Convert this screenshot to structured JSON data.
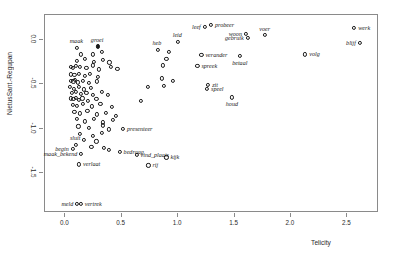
{
  "chart_data": {
    "type": "scatter",
    "title": "",
    "xlabel": "Telicity",
    "ylabel": "NietusSant.-Regupan",
    "xlim": [
      -0.18,
      2.78
    ],
    "ylim": [
      -1.95,
      0.28
    ],
    "xticks": [
      "0.0",
      "0.5",
      "1.0",
      "1.5",
      "2.0",
      "2.5"
    ],
    "xtickvals": [
      0.0,
      0.5,
      1.0,
      1.5,
      2.0,
      2.5
    ],
    "yticks": [
      "0.0",
      "-0.5",
      "-1.0",
      "-1.5"
    ],
    "ytickvals": [
      0.0,
      -0.5,
      -1.0,
      -1.5
    ],
    "grid": false,
    "legend": null,
    "marker": "open-circle",
    "labeled_points": [
      {
        "label": "maak",
        "x": 0.115,
        "y": -0.1,
        "side": "above-left"
      },
      {
        "label": "groei",
        "x": 0.3,
        "y": -0.085,
        "side": "above-left",
        "filled": true
      },
      {
        "label": "leid",
        "x": 1.01,
        "y": -0.035,
        "side": "above-left"
      },
      {
        "label": "heb",
        "x": 0.83,
        "y": -0.125,
        "side": "above-left"
      },
      {
        "label": "leef",
        "x": 1.245,
        "y": 0.135,
        "side": "left"
      },
      {
        "label": "probeer",
        "x": 1.3,
        "y": 0.155,
        "side": "right"
      },
      {
        "label": "woon",
        "x": 1.61,
        "y": 0.06,
        "side": "left"
      },
      {
        "label": "gebruik",
        "x": 1.625,
        "y": 0.015,
        "side": "left"
      },
      {
        "label": "voer",
        "x": 1.775,
        "y": 0.048,
        "side": "above"
      },
      {
        "label": "werk",
        "x": 2.57,
        "y": 0.125,
        "side": "right"
      },
      {
        "label": "blijf",
        "x": 2.62,
        "y": -0.045,
        "side": "left"
      },
      {
        "label": "verander",
        "x": 1.215,
        "y": -0.185,
        "side": "right"
      },
      {
        "label": "spreek",
        "x": 1.18,
        "y": -0.305,
        "side": "right"
      },
      {
        "label": "betaal",
        "x": 1.555,
        "y": -0.195,
        "side": "below"
      },
      {
        "label": "volg",
        "x": 2.135,
        "y": -0.175,
        "side": "right"
      },
      {
        "label": "zit",
        "x": 1.275,
        "y": -0.515,
        "side": "right"
      },
      {
        "label": "speel",
        "x": 1.265,
        "y": -0.565,
        "side": "right"
      },
      {
        "label": "houd",
        "x": 1.485,
        "y": -0.66,
        "side": "below"
      },
      {
        "label": "presenteer",
        "x": 0.52,
        "y": -1.01,
        "side": "right"
      },
      {
        "label": "sluit",
        "x": 0.105,
        "y": -1.195,
        "side": "above-left"
      },
      {
        "label": "begin",
        "x": 0.075,
        "y": -1.24,
        "side": "left"
      },
      {
        "label": "maak_bekend",
        "x": 0.15,
        "y": -1.3,
        "side": "left"
      },
      {
        "label": "bedraag",
        "x": 0.49,
        "y": -1.27,
        "side": "right"
      },
      {
        "label": "vind_plaats",
        "x": 0.64,
        "y": -1.305,
        "side": "right"
      },
      {
        "label": "kijk",
        "x": 0.905,
        "y": -1.335,
        "side": "right"
      },
      {
        "label": "verlaat",
        "x": 0.13,
        "y": -1.415,
        "side": "right"
      },
      {
        "label": "rij",
        "x": 0.745,
        "y": -1.425,
        "side": "right"
      },
      {
        "label": "meld",
        "x": 0.115,
        "y": -1.855,
        "side": "left"
      },
      {
        "label": "vertrek",
        "x": 0.145,
        "y": -1.855,
        "side": "right"
      }
    ],
    "unlabeled_points": [
      {
        "x": 0.15,
        "y": -0.175
      },
      {
        "x": 0.255,
        "y": -0.175
      },
      {
        "x": 0.33,
        "y": -0.145
      },
      {
        "x": 0.115,
        "y": -0.25
      },
      {
        "x": 0.185,
        "y": -0.23
      },
      {
        "x": 0.265,
        "y": -0.255
      },
      {
        "x": 0.345,
        "y": -0.235
      },
      {
        "x": 0.4,
        "y": -0.265
      },
      {
        "x": 0.06,
        "y": -0.315
      },
      {
        "x": 0.075,
        "y": -0.33
      },
      {
        "x": 0.105,
        "y": -0.305
      },
      {
        "x": 0.14,
        "y": -0.32
      },
      {
        "x": 0.195,
        "y": -0.33
      },
      {
        "x": 0.25,
        "y": -0.3
      },
      {
        "x": 0.305,
        "y": -0.345
      },
      {
        "x": 0.415,
        "y": -0.32
      },
      {
        "x": 0.47,
        "y": -0.335
      },
      {
        "x": 0.06,
        "y": -0.4
      },
      {
        "x": 0.09,
        "y": -0.41
      },
      {
        "x": 0.13,
        "y": -0.395
      },
      {
        "x": 0.18,
        "y": -0.42
      },
      {
        "x": 0.23,
        "y": -0.395
      },
      {
        "x": 0.3,
        "y": -0.43
      },
      {
        "x": 0.055,
        "y": -0.47
      },
      {
        "x": 0.08,
        "y": -0.48
      },
      {
        "x": 0.095,
        "y": -0.465
      },
      {
        "x": 0.12,
        "y": -0.49
      },
      {
        "x": 0.165,
        "y": -0.47
      },
      {
        "x": 0.215,
        "y": -0.5
      },
      {
        "x": 0.29,
        "y": -0.48
      },
      {
        "x": 0.05,
        "y": -0.545
      },
      {
        "x": 0.085,
        "y": -0.56
      },
      {
        "x": 0.13,
        "y": -0.545
      },
      {
        "x": 0.175,
        "y": -0.57
      },
      {
        "x": 0.235,
        "y": -0.555
      },
      {
        "x": 0.065,
        "y": -0.61
      },
      {
        "x": 0.1,
        "y": -0.6
      },
      {
        "x": 0.145,
        "y": -0.62
      },
      {
        "x": 0.195,
        "y": -0.605
      },
      {
        "x": 0.255,
        "y": -0.635
      },
      {
        "x": 0.33,
        "y": -0.6
      },
      {
        "x": 0.385,
        "y": -0.635
      },
      {
        "x": 0.055,
        "y": -0.67
      },
      {
        "x": 0.08,
        "y": -0.68
      },
      {
        "x": 0.105,
        "y": -0.665
      },
      {
        "x": 0.13,
        "y": -0.69
      },
      {
        "x": 0.16,
        "y": -0.67
      },
      {
        "x": 0.21,
        "y": -0.7
      },
      {
        "x": 0.285,
        "y": -0.675
      },
      {
        "x": 0.075,
        "y": -0.74
      },
      {
        "x": 0.115,
        "y": -0.755
      },
      {
        "x": 0.165,
        "y": -0.73
      },
      {
        "x": 0.245,
        "y": -0.76
      },
      {
        "x": 0.32,
        "y": -0.735
      },
      {
        "x": 0.425,
        "y": -0.77
      },
      {
        "x": 0.09,
        "y": -0.82
      },
      {
        "x": 0.14,
        "y": -0.84
      },
      {
        "x": 0.205,
        "y": -0.815
      },
      {
        "x": 0.29,
        "y": -0.85
      },
      {
        "x": 0.37,
        "y": -0.83
      },
      {
        "x": 0.46,
        "y": -0.87
      },
      {
        "x": 0.11,
        "y": -0.905
      },
      {
        "x": 0.185,
        "y": -0.93
      },
      {
        "x": 0.265,
        "y": -0.905
      },
      {
        "x": 0.345,
        "y": -0.94
      },
      {
        "x": 0.43,
        "y": -0.915
      },
      {
        "x": 0.125,
        "y": -0.985
      },
      {
        "x": 0.215,
        "y": -1.0
      },
      {
        "x": 0.34,
        "y": -0.975
      },
      {
        "x": 0.395,
        "y": -1.02
      },
      {
        "x": 0.14,
        "y": -1.075
      },
      {
        "x": 0.25,
        "y": -1.09
      },
      {
        "x": 0.33,
        "y": -1.06
      },
      {
        "x": 0.175,
        "y": -1.14
      },
      {
        "x": 0.285,
        "y": -1.155
      },
      {
        "x": 0.24,
        "y": -1.215
      },
      {
        "x": 0.35,
        "y": -1.23
      },
      {
        "x": 0.395,
        "y": -1.255
      },
      {
        "x": 0.865,
        "y": -0.445
      },
      {
        "x": 0.96,
        "y": -0.47
      },
      {
        "x": 0.88,
        "y": -0.53
      },
      {
        "x": 0.93,
        "y": -0.15
      },
      {
        "x": 0.905,
        "y": -0.23
      },
      {
        "x": 0.875,
        "y": -0.3
      },
      {
        "x": 0.68,
        "y": -0.7
      },
      {
        "x": 0.74,
        "y": -0.545
      }
    ]
  }
}
